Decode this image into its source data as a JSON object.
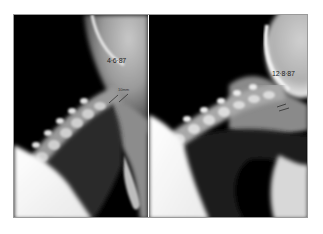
{
  "figure": {
    "panels": [
      {
        "id": "left",
        "date_label": "4·6·87",
        "measurement_label": "10mm"
      },
      {
        "id": "right",
        "date_label": "12·8·87"
      }
    ]
  }
}
